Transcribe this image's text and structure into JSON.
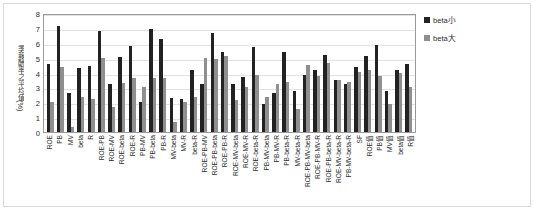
{
  "chart_data": {
    "type": "bar",
    "title": "",
    "subtitle": "",
    "xlabel": "",
    "ylabel": "季報酬率之平均值(%)",
    "ylim": [
      0,
      8
    ],
    "ytick_values": [
      0,
      1,
      2,
      3,
      4,
      5,
      6,
      7,
      8
    ],
    "ytick_labels": [
      "0",
      "1",
      "2",
      "3",
      "4",
      "5",
      "6",
      "7",
      "8"
    ],
    "grid": true,
    "legend_position": "right",
    "categories": [
      "ROE",
      "PB",
      "MV",
      "beta",
      "R",
      "ROE-PB",
      "ROE-MV",
      "ROE-beta",
      "ROE-R",
      "PB-MV",
      "PB-beta",
      "PB-R",
      "MV-beta",
      "MV-R",
      "beta-R",
      "ROE-PB-MV",
      "ROE-PB-beta",
      "ROE-PB-R",
      "ROE-MV-beta",
      "ROE-MV-R",
      "ROE-beta-R",
      "PB-MV-beta",
      "PB-MV-R",
      "PB-beta-R",
      "MV-beta-R",
      "ROE-PB-MV-beta",
      "ROE-PB-MV-R",
      "ROE-PB-beta-R",
      "ROE-MV-beta-R",
      "PB-MV-beta-R",
      "SF",
      "ROE值",
      "PB值",
      "MV值",
      "beta值",
      "R值"
    ],
    "series": [
      {
        "name": "beta小",
        "color": "#222222",
        "values": [
          4.6,
          7.1,
          2.6,
          4.3,
          4.45,
          6.8,
          3.25,
          5.05,
          5.8,
          2.0,
          6.95,
          6.25,
          2.3,
          2.2,
          4.2,
          3.25,
          6.65,
          5.4,
          3.25,
          3.7,
          5.7,
          1.9,
          2.6,
          5.4,
          2.75,
          3.8,
          4.2,
          5.2,
          3.5,
          3.2,
          4.4,
          5.1,
          5.85,
          2.75,
          4.15,
          4.6
        ]
      },
      {
        "name": "beta大",
        "color": "#8f8f8f",
        "values": [
          2.05,
          4.4,
          0.35,
          2.35,
          2.25,
          5.0,
          1.65,
          3.3,
          3.65,
          3.0,
          3.6,
          3.65,
          0.7,
          2.0,
          2.35,
          5.0,
          4.9,
          5.1,
          2.15,
          3.0,
          3.85,
          2.35,
          3.2,
          3.35,
          1.55,
          4.5,
          3.75,
          4.65,
          3.5,
          3.35,
          4.05,
          4.2,
          3.75,
          1.9,
          3.95,
          3.0
        ]
      }
    ]
  },
  "legend": {
    "items": [
      {
        "label": "beta小",
        "swatch": "small"
      },
      {
        "label": "beta大",
        "swatch": "large"
      }
    ]
  }
}
